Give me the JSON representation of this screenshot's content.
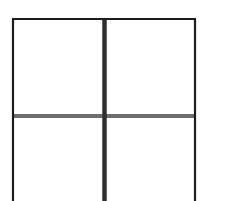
{
  "diagram": {
    "type": "grid-2x2",
    "rows": 2,
    "columns": 2,
    "background": "#ffffff",
    "frame": {
      "left": 13,
      "top": 19,
      "right": 195,
      "stroke": "#1c1c1c",
      "stroke_width": 2.2,
      "closed_bottom": false
    },
    "vertical_divider": {
      "x": 104.5,
      "y_start": 19,
      "y_end": 201,
      "stroke": "#2e2e2e",
      "stroke_width": 4.5
    },
    "horizontal_divider": {
      "y": 116,
      "x_start": 13,
      "x_end": 195,
      "stroke": "#6e6e6e",
      "stroke_width": 4
    },
    "cells": [
      {
        "id": "top-left",
        "label": ""
      },
      {
        "id": "top-right",
        "label": ""
      },
      {
        "id": "bottom-left",
        "label": ""
      },
      {
        "id": "bottom-right",
        "label": ""
      }
    ]
  }
}
